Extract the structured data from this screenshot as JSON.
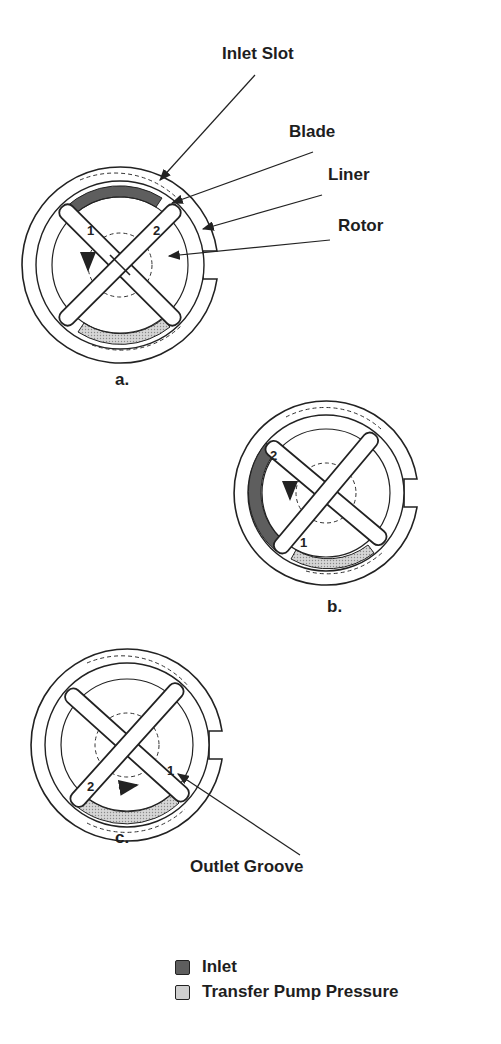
{
  "labels": {
    "inlet_slot": "Inlet Slot",
    "blade": "Blade",
    "liner": "Liner",
    "rotor": "Rotor",
    "outlet_groove": "Outlet Groove"
  },
  "diagrams": [
    {
      "id": "a",
      "caption": "a.",
      "blade_labels": [
        "1",
        "2"
      ]
    },
    {
      "id": "b",
      "caption": "b.",
      "blade_labels": [
        "2",
        "1"
      ]
    },
    {
      "id": "c",
      "caption": "c.",
      "blade_labels": [
        "2",
        "1"
      ]
    }
  ],
  "legend": {
    "items": [
      {
        "label": "Inlet",
        "color": "#5e5e5e"
      },
      {
        "label": "Transfer Pump Pressure",
        "color": "#c8c8c8"
      }
    ]
  }
}
